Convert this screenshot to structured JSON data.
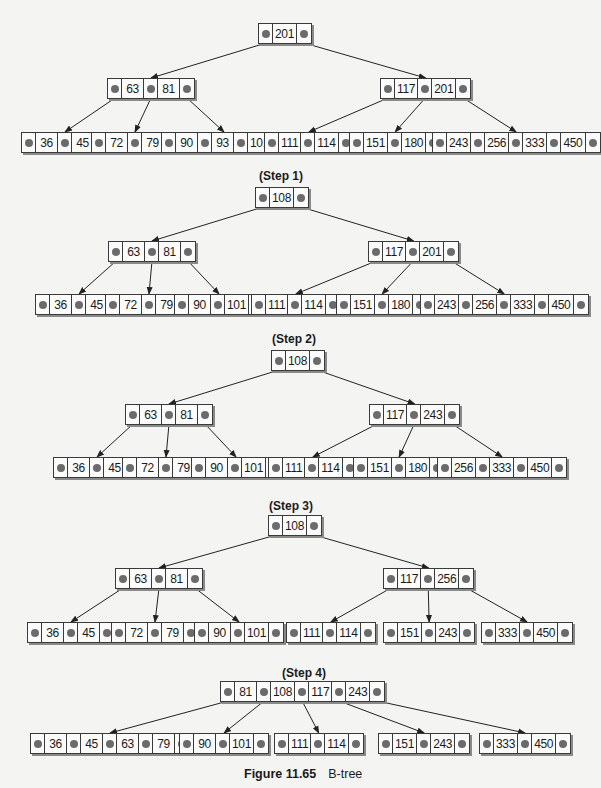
{
  "caption": {
    "figure": "Figure 11.65",
    "title": "B-tree"
  },
  "diagrams": [
    {
      "label": "",
      "label_pos": null,
      "nodes": [
        {
          "id": "r",
          "keys": [
            "201"
          ],
          "x": 258,
          "y": 23
        },
        {
          "id": "a",
          "keys": [
            "63",
            "81"
          ],
          "x": 107,
          "y": 78
        },
        {
          "id": "b",
          "keys": [
            "117",
            "201"
          ],
          "x": 380,
          "y": 78
        },
        {
          "id": "a1",
          "keys": [
            "36",
            "45"
          ],
          "x": 21,
          "y": 132
        },
        {
          "id": "a2",
          "keys": [
            "72",
            "79"
          ],
          "x": 91,
          "y": 132
        },
        {
          "id": "a3",
          "keys": [
            "90",
            "93",
            "101"
          ],
          "x": 161,
          "y": 132
        },
        {
          "id": "b1",
          "keys": [
            "111",
            "114"
          ],
          "x": 264,
          "y": 132
        },
        {
          "id": "b2",
          "keys": [
            "151",
            "180"
          ],
          "x": 349,
          "y": 132
        },
        {
          "id": "b3",
          "keys": [
            "243",
            "256",
            "333",
            "450"
          ],
          "x": 432,
          "y": 132
        }
      ],
      "edges": [
        [
          "r",
          0,
          "a"
        ],
        [
          "r",
          1,
          "b"
        ],
        [
          "a",
          0,
          "a1"
        ],
        [
          "a",
          1,
          "a2"
        ],
        [
          "a",
          2,
          "a3"
        ],
        [
          "b",
          0,
          "b1"
        ],
        [
          "b",
          1,
          "b2"
        ],
        [
          "b",
          2,
          "b3"
        ]
      ]
    },
    {
      "label": "(Step 1)",
      "label_pos": [
        281,
        169
      ],
      "nodes": [
        {
          "id": "r",
          "keys": [
            "108"
          ],
          "x": 255,
          "y": 187
        },
        {
          "id": "a",
          "keys": [
            "63",
            "81"
          ],
          "x": 108,
          "y": 241
        },
        {
          "id": "b",
          "keys": [
            "117",
            "201"
          ],
          "x": 368,
          "y": 241
        },
        {
          "id": "a1",
          "keys": [
            "36",
            "45"
          ],
          "x": 35,
          "y": 294
        },
        {
          "id": "a2",
          "keys": [
            "72",
            "79"
          ],
          "x": 105,
          "y": 294
        },
        {
          "id": "a3",
          "keys": [
            "90",
            "101"
          ],
          "x": 174,
          "y": 294
        },
        {
          "id": "b1",
          "keys": [
            "111",
            "114"
          ],
          "x": 251,
          "y": 294
        },
        {
          "id": "b2",
          "keys": [
            "151",
            "180"
          ],
          "x": 336,
          "y": 294
        },
        {
          "id": "b3",
          "keys": [
            "243",
            "256",
            "333",
            "450"
          ],
          "x": 420,
          "y": 294
        }
      ],
      "edges": [
        [
          "r",
          0,
          "a"
        ],
        [
          "r",
          1,
          "b"
        ],
        [
          "a",
          0,
          "a1"
        ],
        [
          "a",
          1,
          "a2"
        ],
        [
          "a",
          2,
          "a3"
        ],
        [
          "b",
          0,
          "b1"
        ],
        [
          "b",
          1,
          "b2"
        ],
        [
          "b",
          2,
          "b3"
        ]
      ]
    },
    {
      "label": "(Step 2)",
      "label_pos": [
        294,
        332
      ],
      "nodes": [
        {
          "id": "r",
          "keys": [
            "108"
          ],
          "x": 271,
          "y": 350
        },
        {
          "id": "a",
          "keys": [
            "63",
            "81"
          ],
          "x": 125,
          "y": 404
        },
        {
          "id": "b",
          "keys": [
            "117",
            "243"
          ],
          "x": 369,
          "y": 404
        },
        {
          "id": "a1",
          "keys": [
            "36",
            "45"
          ],
          "x": 53,
          "y": 457
        },
        {
          "id": "a2",
          "keys": [
            "72",
            "79"
          ],
          "x": 122,
          "y": 457
        },
        {
          "id": "a3",
          "keys": [
            "90",
            "101"
          ],
          "x": 191,
          "y": 457
        },
        {
          "id": "b1",
          "keys": [
            "111",
            "114"
          ],
          "x": 268,
          "y": 457
        },
        {
          "id": "b2",
          "keys": [
            "151",
            "180"
          ],
          "x": 353,
          "y": 457
        },
        {
          "id": "b3",
          "keys": [
            "256",
            "333",
            "450"
          ],
          "x": 437,
          "y": 457
        }
      ],
      "edges": [
        [
          "r",
          0,
          "a"
        ],
        [
          "r",
          1,
          "b"
        ],
        [
          "a",
          0,
          "a1"
        ],
        [
          "a",
          1,
          "a2"
        ],
        [
          "a",
          2,
          "a3"
        ],
        [
          "b",
          0,
          "b1"
        ],
        [
          "b",
          1,
          "b2"
        ],
        [
          "b",
          2,
          "b3"
        ]
      ]
    },
    {
      "label": "(Step 3)",
      "label_pos": [
        291,
        499
      ],
      "nodes": [
        {
          "id": "r",
          "keys": [
            "108"
          ],
          "x": 268,
          "y": 515
        },
        {
          "id": "a",
          "keys": [
            "63",
            "81"
          ],
          "x": 115,
          "y": 568
        },
        {
          "id": "b",
          "keys": [
            "117",
            "256"
          ],
          "x": 383,
          "y": 568
        },
        {
          "id": "a1",
          "keys": [
            "36",
            "45"
          ],
          "x": 27,
          "y": 622
        },
        {
          "id": "a2",
          "keys": [
            "72",
            "79"
          ],
          "x": 111,
          "y": 622
        },
        {
          "id": "a3",
          "keys": [
            "90",
            "101"
          ],
          "x": 194,
          "y": 622
        },
        {
          "id": "b1",
          "keys": [
            "111",
            "114"
          ],
          "x": 286,
          "y": 622
        },
        {
          "id": "b2",
          "keys": [
            "151",
            "243"
          ],
          "x": 383,
          "y": 622
        },
        {
          "id": "b3",
          "keys": [
            "333",
            "450"
          ],
          "x": 481,
          "y": 622
        }
      ],
      "edges": [
        [
          "r",
          0,
          "a"
        ],
        [
          "r",
          1,
          "b"
        ],
        [
          "a",
          0,
          "a1"
        ],
        [
          "a",
          1,
          "a2"
        ],
        [
          "a",
          2,
          "a3"
        ],
        [
          "b",
          0,
          "b1"
        ],
        [
          "b",
          1,
          "b2"
        ],
        [
          "b",
          2,
          "b3"
        ]
      ]
    },
    {
      "label": "(Step 4)",
      "label_pos": [
        304,
        666
      ],
      "nodes": [
        {
          "id": "r",
          "keys": [
            "81",
            "108",
            "117",
            "243"
          ],
          "x": 220,
          "y": 681
        },
        {
          "id": "c1",
          "keys": [
            "36",
            "45",
            "63",
            "79"
          ],
          "x": 30,
          "y": 733
        },
        {
          "id": "c2",
          "keys": [
            "90",
            "101"
          ],
          "x": 179,
          "y": 733
        },
        {
          "id": "c3",
          "keys": [
            "111",
            "114"
          ],
          "x": 274,
          "y": 733
        },
        {
          "id": "c4",
          "keys": [
            "151",
            "243"
          ],
          "x": 378,
          "y": 733
        },
        {
          "id": "c5",
          "keys": [
            "333",
            "450"
          ],
          "x": 479,
          "y": 733
        }
      ],
      "edges": [
        [
          "r",
          0,
          "c1"
        ],
        [
          "r",
          1,
          "c2"
        ],
        [
          "r",
          2,
          "c3"
        ],
        [
          "r",
          3,
          "c4"
        ],
        [
          "r",
          4,
          "c5"
        ]
      ]
    }
  ]
}
